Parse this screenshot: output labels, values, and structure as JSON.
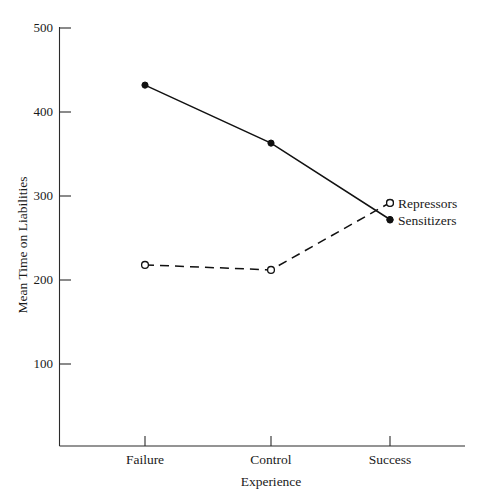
{
  "chart_data": {
    "type": "line",
    "title": "",
    "subtitle": "",
    "xlabel": "Experience",
    "ylabel": "Mean Time on Liabilities",
    "categories": [
      "Failure",
      "Control",
      "Success"
    ],
    "ylim": [
      0,
      500
    ],
    "yticks": [
      100,
      200,
      300,
      400,
      500
    ],
    "ytick_labels": [
      "100",
      "200",
      "300",
      "400",
      "500"
    ],
    "grid": false,
    "legend_position": "right-inside",
    "series": [
      {
        "name": "Sensitizers",
        "values": [
          432,
          363,
          272
        ],
        "linestyle": "solid",
        "marker": "filled-circle",
        "color": "#111111"
      },
      {
        "name": "Repressors",
        "values": [
          218,
          212,
          292
        ],
        "linestyle": "dashed",
        "marker": "open-circle",
        "color": "#111111"
      }
    ]
  },
  "axes": {
    "y_tick_labels": [
      "500",
      "400",
      "300",
      "200",
      "100"
    ],
    "y_axis_title": "Mean Time on Liabilities",
    "x_tick_labels": [
      "Failure",
      "Control",
      "Success"
    ],
    "x_axis_title": "Experience"
  },
  "legend": {
    "entries": [
      {
        "label": "Repressors",
        "marker": "open-circle"
      },
      {
        "label": "Sensitizers",
        "marker": "filled-circle"
      }
    ]
  },
  "colors": {
    "ink": "#111111",
    "axis": "#2b2b2b",
    "background": "#ffffff"
  }
}
